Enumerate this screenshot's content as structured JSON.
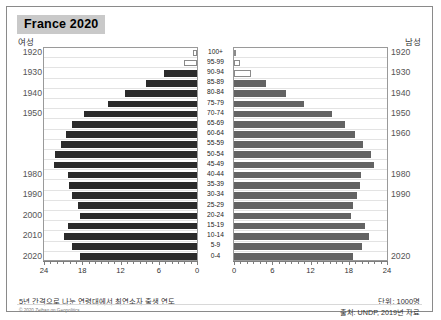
{
  "header": {
    "title": "France 2020",
    "female_label": "여성",
    "male_label": "남성"
  },
  "footer": {
    "note": "5년 간격으로 나눈 연령대에서 최연소자 출생 연도",
    "unit": "단위: 1000명",
    "copyright": "© 2020 Zeihan on Geopolitics",
    "source": "출처: UNDP, 2019년 자료"
  },
  "colors": {
    "female_bar": "#2b2b2b",
    "male_bar": "#636363",
    "title_badge": "#c9c9c9",
    "gridline": "#e3e3e3",
    "axis": "#7d7d7d"
  },
  "chart_data": {
    "type": "bar",
    "title": "France 2020",
    "subtype": "population-pyramid",
    "xlabel": "",
    "ylabel": "",
    "unit": "thousands",
    "xlim": [
      0,
      24
    ],
    "xticks": [
      0,
      6,
      12,
      18,
      24
    ],
    "left_axis_ticklabels": [
      "24",
      "18",
      "12",
      "6",
      "0"
    ],
    "right_axis_ticklabels": [
      "0",
      "6",
      "12",
      "18",
      "24"
    ],
    "grid": true,
    "legend": [
      "여성",
      "남성"
    ],
    "categories": [
      "100+",
      "95-99",
      "90-94",
      "85-89",
      "80-84",
      "75-79",
      "70-74",
      "65-69",
      "60-64",
      "55-59",
      "50-54",
      "45-49",
      "40-44",
      "35-39",
      "30-34",
      "25-29",
      "20-24",
      "15-19",
      "10-14",
      "5-9",
      "0-4"
    ],
    "birth_years_left": [
      {
        "category": "100+",
        "year": "1920"
      },
      {
        "category": "90-94",
        "year": "1930"
      },
      {
        "category": "80-84",
        "year": "1940"
      },
      {
        "category": "70-74",
        "year": "1950"
      },
      {
        "category": "40-44",
        "year": "1980"
      },
      {
        "category": "30-34",
        "year": "1990"
      },
      {
        "category": "20-24",
        "year": "2000"
      },
      {
        "category": "10-14",
        "year": "2010"
      },
      {
        "category": "0-4",
        "year": "2020"
      }
    ],
    "birth_years_right": [
      {
        "category": "100+",
        "year": "1920"
      },
      {
        "category": "90-94",
        "year": "1930"
      },
      {
        "category": "80-84",
        "year": "1940"
      },
      {
        "category": "70-74",
        "year": "1950"
      },
      {
        "category": "60-64",
        "year": "1960"
      },
      {
        "category": "40-44",
        "year": "1980"
      },
      {
        "category": "30-34",
        "year": "1990"
      },
      {
        "category": "0-4",
        "year": "2020"
      }
    ],
    "series": [
      {
        "name": "여성",
        "side": "left",
        "color": "#2b2b2b",
        "values": [
          0.6,
          2.1,
          5.2,
          8.0,
          11.3,
          14.0,
          17.8,
          19.6,
          20.6,
          21.4,
          22.2,
          22.4,
          20.2,
          20.1,
          19.6,
          18.7,
          18.3,
          20.2,
          20.8,
          19.6,
          18.3
        ]
      },
      {
        "name": "남성",
        "side": "right",
        "color": "#636363",
        "values": [
          0.2,
          0.9,
          2.7,
          5.0,
          8.1,
          11.0,
          15.4,
          17.4,
          19.0,
          20.2,
          21.5,
          22.0,
          19.9,
          19.8,
          19.3,
          18.6,
          18.4,
          20.5,
          21.2,
          20.0,
          18.7
        ]
      }
    ],
    "hollow_bars": [
      {
        "series": "여성",
        "categories": [
          "100+",
          "95-99"
        ]
      },
      {
        "series": "남성",
        "categories": [
          "100+",
          "95-99",
          "90-94"
        ]
      }
    ]
  }
}
